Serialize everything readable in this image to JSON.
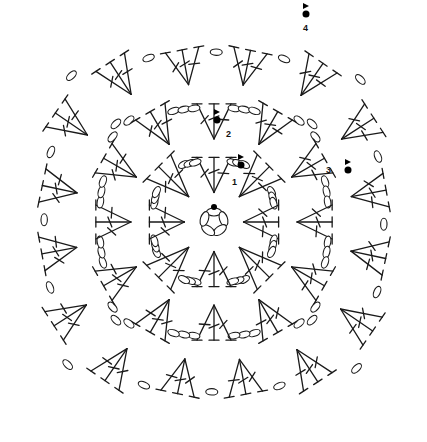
{
  "diagram": {
    "center": [
      214,
      222
    ],
    "colors": {
      "ink": "#1a1a1a",
      "background": "#ffffff",
      "marker": "#000000"
    },
    "ring": {
      "chain_count": 5
    },
    "rounds": [
      {
        "round": 1,
        "radius": 70,
        "fans": 8,
        "chains_between": 3,
        "angle_offset": -90
      },
      {
        "round": 2,
        "radius": 128,
        "fans": 12,
        "chains_between": 3,
        "angle_offset": -90
      },
      {
        "round": 3,
        "radius": 188,
        "fans": 16,
        "chains_between": 1,
        "angle_offset": -78
      }
    ],
    "round_labels": [
      {
        "text": "1",
        "x": 232,
        "y": 185
      },
      {
        "text": "2",
        "x": 226,
        "y": 137
      },
      {
        "text": "3",
        "x": 326,
        "y": 173
      },
      {
        "text": "4",
        "x": 303,
        "y": 31
      }
    ],
    "start_markers": [
      {
        "round": 1,
        "x": 241,
        "y": 165
      },
      {
        "round": 2,
        "x": 217,
        "y": 120
      },
      {
        "round": 3,
        "x": 348,
        "y": 170
      },
      {
        "round": 4,
        "x": 306,
        "y": 14
      }
    ],
    "legend": {
      "symbols": [
        "chain",
        "slip stitch",
        "treble",
        "treble crossed"
      ]
    }
  }
}
